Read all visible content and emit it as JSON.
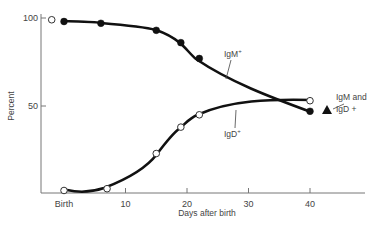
{
  "chart_data": {
    "type": "line",
    "title": "",
    "xlabel": "Days after birth",
    "ylabel": "Percent",
    "xlim": [
      -3,
      48
    ],
    "ylim": [
      0,
      100
    ],
    "x_ticks": [
      {
        "value": 0,
        "label": "Birth"
      },
      {
        "value": 10,
        "label": "10"
      },
      {
        "value": 20,
        "label": "20"
      },
      {
        "value": 30,
        "label": "30"
      },
      {
        "value": 40,
        "label": "40"
      }
    ],
    "y_ticks": [
      {
        "value": 50,
        "label": "50"
      },
      {
        "value": 100,
        "label": "100"
      }
    ],
    "grid": false,
    "series": [
      {
        "name": "IgM+",
        "label": "IgM",
        "label_sup": "+",
        "marker": "filled-circle",
        "x": [
          0,
          6,
          15,
          19,
          22,
          40
        ],
        "y": [
          98,
          97,
          93,
          86,
          77,
          47
        ]
      },
      {
        "name": "IgD+",
        "label": "IgD",
        "label_sup": "+",
        "marker": "open-circle",
        "x": [
          -2,
          0,
          7,
          15,
          19,
          22,
          40
        ],
        "y": [
          99,
          2,
          3,
          23,
          38,
          45,
          53
        ]
      },
      {
        "name": "IgM and IgD +",
        "label_line1": "IgM and",
        "label_line2": "IgD +",
        "marker": "filled-triangle",
        "x": [
          42
        ],
        "y": [
          50
        ]
      }
    ]
  }
}
